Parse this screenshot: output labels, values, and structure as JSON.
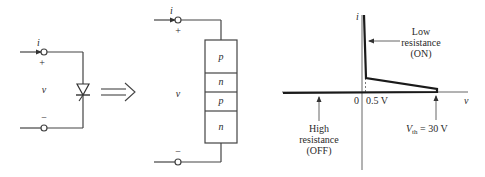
{
  "figure": {
    "left_circuit": {
      "current_label": "i",
      "plus_label": "+",
      "minus_label": "−",
      "voltage_label": "v",
      "device": "thyristor-diode-symbol"
    },
    "transform_arrow": "double-arrow-right",
    "middle_circuit": {
      "current_label": "i",
      "plus_label": "+",
      "minus_label": "−",
      "voltage_label": "v",
      "layers": [
        "p",
        "n",
        "p",
        "n"
      ]
    },
    "iv_graph": {
      "y_axis_label": "i",
      "x_axis_label": "v",
      "origin_label": "0",
      "on_voltage_label": "0.5 V",
      "threshold_label_main": "V",
      "threshold_label_sub": "th",
      "threshold_label_value": " = 30 V",
      "on_annotation": [
        "Low",
        "resistance",
        "(ON)"
      ],
      "off_annotation": [
        "High",
        "resistance",
        "(OFF)"
      ]
    }
  }
}
